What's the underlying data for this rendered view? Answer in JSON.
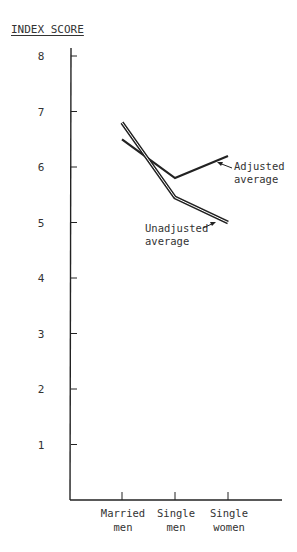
{
  "chart_data": {
    "type": "line",
    "title": "",
    "ylabel": "INDEX SCORE",
    "xlabel": "",
    "categories": [
      "Married men",
      "Single men",
      "Single women"
    ],
    "category_lines": [
      [
        "Married",
        "men"
      ],
      [
        "Single",
        "men"
      ],
      [
        "Single",
        "women"
      ]
    ],
    "series": [
      {
        "name": "Adjusted average",
        "label_lines": [
          "Adjusted",
          "average"
        ],
        "style": "single",
        "values": [
          6.5,
          5.8,
          6.2
        ]
      },
      {
        "name": "Unadjusted average",
        "label_lines": [
          "Unadjusted",
          "average"
        ],
        "style": "double",
        "values": [
          6.8,
          5.45,
          5.0
        ]
      }
    ],
    "yticks": [
      1,
      2,
      3,
      4,
      5,
      6,
      7,
      8
    ],
    "ylim": [
      0,
      8.2
    ],
    "grid": false,
    "legend": "inline annotations with arrows",
    "colors": {
      "line": "#222222",
      "axis": "#222222",
      "background": "#ffffff"
    }
  }
}
